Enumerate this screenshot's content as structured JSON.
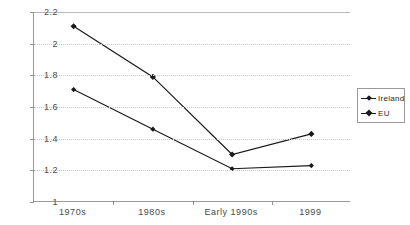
{
  "chart_data": {
    "type": "line",
    "title": "",
    "title_note": "title row is clipped off the top edge of the screenshot",
    "xlabel": "",
    "ylabel": "",
    "categories": [
      "1970s",
      "1980s",
      "Early 1990s",
      "1999"
    ],
    "series": [
      {
        "name": "Ireland",
        "values": [
          1.71,
          1.46,
          1.21,
          1.23
        ],
        "marker": "diamond",
        "color": "#1a1a1a"
      },
      {
        "name": "EU",
        "values": [
          2.11,
          1.79,
          1.3,
          1.43
        ],
        "marker": "diamond",
        "color": "#1a1a1a"
      }
    ],
    "ylim": [
      1,
      2.2
    ],
    "yticks": [
      1,
      1.2,
      1.4,
      1.6,
      1.8,
      2,
      2.2
    ],
    "ytick_labels": [
      "1",
      "1.2",
      "1.4",
      "1.6",
      "1.8",
      "2",
      "2.2"
    ],
    "grid": true,
    "grid_style": "dotted-horizontal",
    "legend_position": "right"
  },
  "legend": {
    "entries": [
      {
        "label": "Ireland"
      },
      {
        "label": "EU"
      }
    ]
  },
  "colors": {
    "axis": "#9a9a9a",
    "grid": "#c9c9c9",
    "line": "#1a1a1a",
    "text": "#4a4a4a",
    "background": "#ffffff"
  }
}
